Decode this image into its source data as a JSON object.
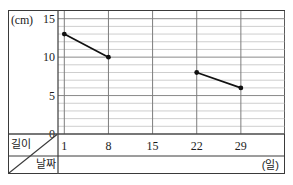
{
  "figure": {
    "title_remnant": "",
    "y_unit_label": "(cm)",
    "x_unit_label": "(일)",
    "corner_row_label": "길이",
    "corner_col_label": "날짜"
  },
  "colors": {
    "frame": "#3a3a3a",
    "axis": "#4a4a4a",
    "major_grid": "#7d7d7d",
    "minor_grid": "#b9b9b9",
    "series_line": "#111111",
    "marker": "#111111",
    "background": "#ffffff"
  },
  "chart_data": {
    "type": "line",
    "title": "",
    "xlabel": "(일)",
    "ylabel": "(cm)",
    "xlim": [
      0,
      36
    ],
    "ylim": [
      0,
      16
    ],
    "x_ticks": [
      1,
      8,
      15,
      22,
      29
    ],
    "x_tick_labels": [
      "1",
      "8",
      "15",
      "22",
      "29"
    ],
    "y_ticks": [
      0,
      5,
      10,
      15
    ],
    "y_tick_labels": [
      "0",
      "5",
      "10",
      "15"
    ],
    "y_minor_step": 1,
    "grid": true,
    "legend": "none",
    "series": [
      {
        "name": "길이",
        "points": [
          {
            "x": 1,
            "y": 13
          },
          {
            "x": 8,
            "y": 10
          },
          {
            "x": 22,
            "y": 8
          },
          {
            "x": 29,
            "y": 6
          }
        ],
        "segments": [
          [
            0,
            1
          ],
          [
            2,
            3
          ]
        ],
        "gap_at_x": [
          15
        ]
      }
    ]
  }
}
